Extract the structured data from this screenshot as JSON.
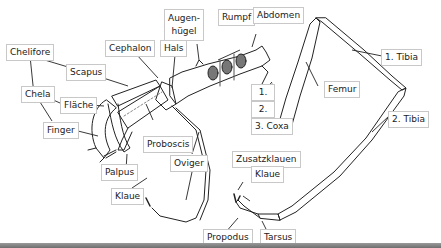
{
  "diagram": {
    "colors": {
      "line": "#222222",
      "label_border": "#c8c8c8",
      "bottom_bar": "#808080"
    },
    "labels": {
      "chelifore": "Chelifore",
      "scapus": "Scapus",
      "chela": "Chela",
      "flaeche": "Fläche",
      "finger": "Finger",
      "cephalon": "Cephalon",
      "hals": "Hals",
      "augenhuegel_1": "Augen-",
      "augenhuegel_2": "hügel",
      "rumpf": "Rumpf",
      "abdomen": "Abdomen",
      "proboscis": "Proboscis",
      "palpus": "Palpus",
      "oviger": "Oviger",
      "klaue_oviger": "Klaue",
      "coxa1": "1.",
      "coxa2": "2.",
      "coxa3": "3. Coxa",
      "femur": "Femur",
      "tibia1": "1. Tibia",
      "tibia2": "2. Tibia",
      "zusatzklauen": "Zusatzklauen",
      "klaue_leg": "Klaue",
      "propodus": "Propodus",
      "tarsus": "Tarsus"
    }
  }
}
